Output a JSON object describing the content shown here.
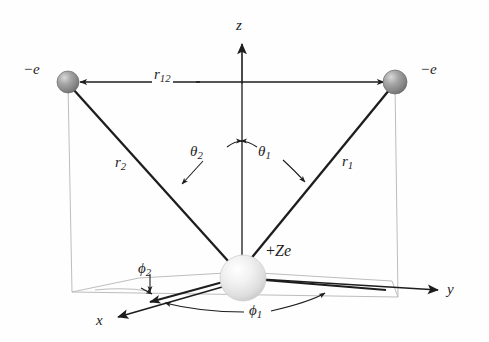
{
  "figure": {
    "colors": {
      "ink": "#1d1d1d",
      "plane_line": "#b8b8b8",
      "nucleus_fill": "#e9e9e9",
      "nucleus_edge": "#c9c9c9",
      "electron_fill": "#8f8f8f",
      "electron_edge": "#6e6e6e",
      "background": "#fefefe"
    }
  },
  "axes": {
    "z": {
      "label": "z",
      "icon": "axis-arrow-up"
    },
    "y": {
      "label": "y",
      "icon": "axis-arrow-right"
    },
    "x": {
      "label": "x",
      "icon": "axis-arrow-down-left"
    }
  },
  "particles": {
    "nucleus": {
      "label_plus": "+",
      "label_charge": "Ze",
      "label": "+Ze",
      "icon": "nucleus-sphere"
    },
    "electron_left": {
      "label": "−e",
      "icon": "electron-sphere"
    },
    "electron_right": {
      "label": "−e",
      "icon": "electron-sphere"
    }
  },
  "distances": {
    "r1": {
      "base": "r",
      "sub": "1"
    },
    "r2": {
      "base": "r",
      "sub": "2"
    },
    "r12": {
      "base": "r",
      "sub": "12"
    }
  },
  "angles": {
    "theta1": {
      "base": "θ",
      "sub": "1"
    },
    "theta2": {
      "base": "θ",
      "sub": "2"
    },
    "phi1": {
      "base": "ϕ",
      "sub": "1"
    },
    "phi2": {
      "base": "ϕ",
      "sub": "2"
    }
  }
}
